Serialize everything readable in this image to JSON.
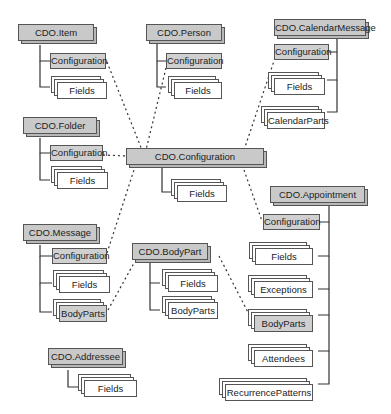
{
  "diagram": {
    "objects": {
      "item": {
        "label": "CDO.Item",
        "children": [
          "Configuration",
          "Fields"
        ]
      },
      "person": {
        "label": "CDO.Person",
        "children": [
          "Configuration",
          "Fields"
        ]
      },
      "calendar_message": {
        "label": "CDO.CalendarMessage",
        "children": [
          "Configuration",
          "Fields",
          "CalendarParts"
        ]
      },
      "folder": {
        "label": "CDO.Folder",
        "children": [
          "Configuration",
          "Fields"
        ]
      },
      "configuration": {
        "label": "CDO.Configuration",
        "children": [
          "Fields"
        ]
      },
      "message": {
        "label": "CDO.Message",
        "children": [
          "Configuration",
          "Fields",
          "BodyParts"
        ]
      },
      "body_part": {
        "label": "CDO.BodyPart",
        "children": [
          "Fields",
          "BodyParts"
        ]
      },
      "appointment": {
        "label": "CDO.Appointment",
        "children": [
          "Configuration",
          "Fields",
          "Exceptions",
          "BodyParts",
          "Attendees",
          "RecurrencePatterns"
        ]
      },
      "addressee": {
        "label": "CDO.Addressee",
        "children": [
          "Fields"
        ]
      }
    },
    "labels": {
      "configuration": "Configuration",
      "fields": "Fields",
      "calendar_parts": "CalendarParts",
      "body_parts": "BodyParts",
      "exceptions": "Exceptions",
      "attendees": "Attendees",
      "recurrence_patterns": "RecurrencePatterns"
    },
    "links": [
      {
        "from": "CDO.Item/Configuration",
        "to": "CDO.Configuration",
        "style": "dotted"
      },
      {
        "from": "CDO.Person/Configuration",
        "to": "CDO.Configuration",
        "style": "dotted"
      },
      {
        "from": "CDO.CalendarMessage/Configuration",
        "to": "CDO.Configuration",
        "style": "dotted"
      },
      {
        "from": "CDO.Folder/Configuration",
        "to": "CDO.Configuration",
        "style": "dotted"
      },
      {
        "from": "CDO.Message/Configuration",
        "to": "CDO.Configuration",
        "style": "dotted"
      },
      {
        "from": "CDO.Appointment/Configuration",
        "to": "CDO.Configuration",
        "style": "dotted"
      },
      {
        "from": "CDO.Message/BodyParts",
        "to": "CDO.BodyPart",
        "style": "dotted"
      },
      {
        "from": "CDO.Appointment/BodyParts",
        "to": "CDO.BodyPart",
        "style": "dotted"
      }
    ],
    "colors": {
      "object_fill": "#c9c9c9",
      "interface_fill": "#d0d0d0",
      "collection_fill": "#ffffff",
      "stroke": "#555555"
    }
  }
}
